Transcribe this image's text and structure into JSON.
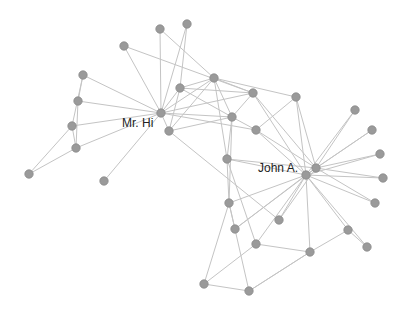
{
  "graph": {
    "node_color": "#9a9a9a",
    "edge_color": "#c4c4c4",
    "label_color": "#222222",
    "node_radius": 4.2,
    "labels": [
      {
        "text": "Mr. Hi",
        "node": 0,
        "x": 122,
        "y": 127
      },
      {
        "text": "John A.",
        "node": 33,
        "x": 258,
        "y": 172
      }
    ],
    "nodes": [
      {
        "id": 0,
        "x": 161,
        "y": 113
      },
      {
        "id": 1,
        "x": 180,
        "y": 88
      },
      {
        "id": 2,
        "x": 232,
        "y": 117
      },
      {
        "id": 3,
        "x": 214,
        "y": 78
      },
      {
        "id": 4,
        "x": 124,
        "y": 46
      },
      {
        "id": 5,
        "x": 83,
        "y": 75
      },
      {
        "id": 6,
        "x": 78,
        "y": 101
      },
      {
        "id": 7,
        "x": 169,
        "y": 131
      },
      {
        "id": 8,
        "x": 256,
        "y": 130
      },
      {
        "id": 9,
        "x": 227,
        "y": 159
      },
      {
        "id": 10,
        "x": 160,
        "y": 29
      },
      {
        "id": 11,
        "x": 104,
        "y": 181
      },
      {
        "id": 12,
        "x": 187,
        "y": 24
      },
      {
        "id": 13,
        "x": 253,
        "y": 93
      },
      {
        "id": 14,
        "x": 72,
        "y": 126
      },
      {
        "id": 15,
        "x": 76,
        "y": 148
      },
      {
        "id": 16,
        "x": 29,
        "y": 174
      },
      {
        "id": 17,
        "x": 355,
        "y": 110
      },
      {
        "id": 18,
        "x": 372,
        "y": 130
      },
      {
        "id": 19,
        "x": 380,
        "y": 154
      },
      {
        "id": 20,
        "x": 383,
        "y": 178
      },
      {
        "id": 21,
        "x": 375,
        "y": 203
      },
      {
        "id": 22,
        "x": 296,
        "y": 97
      },
      {
        "id": 23,
        "x": 229,
        "y": 203
      },
      {
        "id": 24,
        "x": 235,
        "y": 229
      },
      {
        "id": 25,
        "x": 279,
        "y": 220
      },
      {
        "id": 26,
        "x": 256,
        "y": 244
      },
      {
        "id": 27,
        "x": 310,
        "y": 252
      },
      {
        "id": 28,
        "x": 348,
        "y": 230
      },
      {
        "id": 29,
        "x": 367,
        "y": 247
      },
      {
        "id": 30,
        "x": 204,
        "y": 284
      },
      {
        "id": 31,
        "x": 249,
        "y": 291
      },
      {
        "id": 32,
        "x": 316,
        "y": 168
      },
      {
        "id": 33,
        "x": 306,
        "y": 175
      }
    ],
    "edges": [
      [
        0,
        1
      ],
      [
        0,
        2
      ],
      [
        0,
        3
      ],
      [
        0,
        4
      ],
      [
        0,
        5
      ],
      [
        0,
        6
      ],
      [
        0,
        7
      ],
      [
        0,
        8
      ],
      [
        0,
        10
      ],
      [
        0,
        11
      ],
      [
        0,
        12
      ],
      [
        0,
        13
      ],
      [
        0,
        14
      ],
      [
        0,
        15
      ],
      [
        1,
        3
      ],
      [
        1,
        13
      ],
      [
        1,
        2
      ],
      [
        1,
        7
      ],
      [
        1,
        12
      ],
      [
        2,
        3
      ],
      [
        2,
        7
      ],
      [
        2,
        8
      ],
      [
        2,
        9
      ],
      [
        2,
        13
      ],
      [
        2,
        23
      ],
      [
        3,
        13
      ],
      [
        3,
        7
      ],
      [
        3,
        10
      ],
      [
        3,
        9
      ],
      [
        3,
        22
      ],
      [
        4,
        13
      ],
      [
        5,
        6
      ],
      [
        5,
        14
      ],
      [
        6,
        15
      ],
      [
        14,
        15
      ],
      [
        14,
        16
      ],
      [
        15,
        16
      ],
      [
        8,
        33
      ],
      [
        8,
        32
      ],
      [
        8,
        22
      ],
      [
        9,
        33
      ],
      [
        9,
        23
      ],
      [
        9,
        26
      ],
      [
        13,
        33
      ],
      [
        13,
        32
      ],
      [
        22,
        32
      ],
      [
        22,
        33
      ],
      [
        17,
        33
      ],
      [
        17,
        32
      ],
      [
        18,
        33
      ],
      [
        18,
        32
      ],
      [
        19,
        33
      ],
      [
        19,
        32
      ],
      [
        20,
        33
      ],
      [
        20,
        32
      ],
      [
        21,
        33
      ],
      [
        21,
        32
      ],
      [
        23,
        24
      ],
      [
        23,
        30
      ],
      [
        23,
        33
      ],
      [
        23,
        31
      ],
      [
        24,
        33
      ],
      [
        24,
        32
      ],
      [
        25,
        33
      ],
      [
        25,
        32
      ],
      [
        26,
        27
      ],
      [
        26,
        30
      ],
      [
        26,
        33
      ],
      [
        27,
        28
      ],
      [
        27,
        31
      ],
      [
        27,
        33
      ],
      [
        28,
        33
      ],
      [
        28,
        29
      ],
      [
        29,
        33
      ],
      [
        30,
        31
      ],
      [
        31,
        27
      ],
      [
        32,
        33
      ],
      [
        9,
        32
      ],
      [
        7,
        25
      ]
    ]
  }
}
